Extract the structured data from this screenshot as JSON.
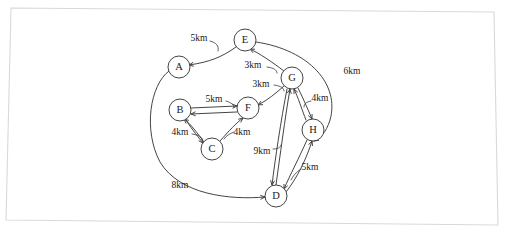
{
  "diagram": {
    "type": "node-link-graph",
    "background_color": "#ffffff",
    "border_color": "#d7d9dd",
    "stroke_color": "#3a3a3a",
    "unit": "km",
    "nodes": [
      {
        "id": "A",
        "label": "A",
        "x": 179,
        "y": 67,
        "r": 11
      },
      {
        "id": "B",
        "label": "B",
        "x": 180,
        "y": 110,
        "r": 11
      },
      {
        "id": "C",
        "label": "C",
        "x": 212,
        "y": 149,
        "r": 11
      },
      {
        "id": "D",
        "label": "D",
        "x": 276,
        "y": 196,
        "r": 11
      },
      {
        "id": "E",
        "label": "E",
        "x": 245,
        "y": 40,
        "r": 11
      },
      {
        "id": "F",
        "label": "F",
        "x": 248,
        "y": 108,
        "r": 11
      },
      {
        "id": "G",
        "label": "G",
        "x": 292,
        "y": 78,
        "r": 11
      },
      {
        "id": "H",
        "label": "H",
        "x": 313,
        "y": 130,
        "r": 11
      }
    ],
    "edges": [
      {
        "id": "e-ae",
        "from": "E",
        "to": "A",
        "weight": "5km",
        "path": "M 236 47 C 222 57 210 62 189 65",
        "arrow_at": "A",
        "arrow_angle": 170,
        "label_x": 199,
        "label_y": 39,
        "leader": "M 210 41 C 217 43 219 46 218 51"
      },
      {
        "id": "e-ge",
        "from": "G",
        "to": "E",
        "weight": "3km",
        "path": "M 284 71 C 272 62 259 53 250 49",
        "arrow_at": "E",
        "arrow_angle": 206,
        "label_x": 253,
        "label_y": 66,
        "leader": "M 267 67 C 274 68 277 70 277 73"
      },
      {
        "id": "e-gf",
        "from": "G",
        "to": "F",
        "weight": "3km",
        "path": "M 284 86 C 276 93 268 100 258 105",
        "arrow_at": "F",
        "arrow_angle": 152,
        "label_x": 261,
        "label_y": 85,
        "leader": "M 274 85 C 281 86 284 88 284 91"
      },
      {
        "id": "e-bf",
        "from": "B",
        "to": "F",
        "weight": "5km",
        "path": "M 191 108 L 237 106",
        "arrow_at": "F",
        "arrow_angle": 177,
        "label_x": 214,
        "label_y": 100,
        "leader": "M 226 101 C 232 103 234 105 234 107"
      },
      {
        "id": "e-fb",
        "from": "F",
        "to": "B",
        "weight": "",
        "path": "M 237 112 L 191 114",
        "arrow_at": "B",
        "arrow_angle": 357,
        "label_x": 0,
        "label_y": 0,
        "leader": ""
      },
      {
        "id": "e-bc",
        "from": "B",
        "to": "C",
        "weight": "4km",
        "path": "M 186 120 C 193 131 199 138 203 143",
        "arrow_at": "C",
        "arrow_angle": 126,
        "label_x": 180,
        "label_y": 133,
        "leader": "M 192 134 C 198 135 201 136 202 139"
      },
      {
        "id": "e-cb",
        "from": "C",
        "to": "B",
        "weight": "",
        "path": "M 204 142 C 197 133 191 124 184 119",
        "arrow_at": "B",
        "arrow_angle": 310,
        "label_x": 0,
        "label_y": 0,
        "leader": ""
      },
      {
        "id": "e-cf",
        "from": "C",
        "to": "F",
        "weight": "4km",
        "path": "M 220 141 C 229 131 236 123 243 118",
        "arrow_at": "F",
        "arrow_angle": 305,
        "label_x": 242,
        "label_y": 133,
        "leader": "M 234 132 C 229 134 226 136 224 139"
      },
      {
        "id": "e-gd",
        "from": "G",
        "to": "D",
        "weight": "9km",
        "path": "M 287 89 C 281 120 275 160 272 185",
        "arrow_at": "D",
        "arrow_angle": 97,
        "label_x": 262,
        "label_y": 152,
        "leader": "M 273 149 C 278 149 280 148 281 145"
      },
      {
        "id": "e-dg",
        "from": "D",
        "to": "G",
        "weight": "",
        "path": "M 276 185 C 280 156 285 118 290 89",
        "arrow_at": "G",
        "arrow_angle": 279,
        "label_x": 0,
        "label_y": 0,
        "leader": ""
      },
      {
        "id": "e-gh",
        "from": "G",
        "to": "H",
        "weight": "4km",
        "path": "M 298 88 C 304 100 309 112 312 119",
        "arrow_at": "H",
        "arrow_angle": 110,
        "label_x": 320,
        "label_y": 99,
        "leader": "M 311 101 C 306 102 304 104 304 107"
      },
      {
        "id": "e-hg",
        "from": "H",
        "to": "G",
        "weight": "",
        "path": "M 306 120 C 302 110 298 97 294 89",
        "arrow_at": "G",
        "arrow_angle": 293,
        "label_x": 0,
        "label_y": 0,
        "leader": ""
      },
      {
        "id": "e-hd",
        "from": "H",
        "to": "D",
        "weight": "5km",
        "path": "M 307 140 C 299 158 290 175 284 189",
        "arrow_at": "D",
        "arrow_angle": 113,
        "label_x": 310,
        "label_y": 168,
        "leader": "M 301 169 C 296 172 293 176 291 180"
      },
      {
        "id": "e-dh",
        "from": "D",
        "to": "H",
        "weight": "",
        "path": "M 286 192 C 297 178 306 160 312 141",
        "arrow_at": "H",
        "arrow_angle": 290,
        "label_x": 0,
        "label_y": 0,
        "leader": ""
      },
      {
        "id": "e-eh",
        "from": "E",
        "to": "H",
        "weight": "6km",
        "path": "M 256 42 C 310 50 340 85 330 120 C 326 133 320 138 314 141",
        "arrow_at": "H",
        "arrow_angle": 160,
        "label_x": 352,
        "label_y": 72,
        "leader": ""
      },
      {
        "id": "e-ad",
        "from": "A",
        "to": "D",
        "weight": "8km",
        "path": "M 169 71 C 150 85 143 130 160 162 C 180 195 230 200 265 197",
        "arrow_at": "D",
        "arrow_angle": 356,
        "label_x": 180,
        "label_y": 186,
        "leader": ""
      }
    ],
    "edge_list_readable": [
      {
        "from": "E",
        "to": "A",
        "distance": "5km"
      },
      {
        "from": "G",
        "to": "E",
        "distance": "3km"
      },
      {
        "from": "G",
        "to": "F",
        "distance": "3km"
      },
      {
        "from": "B",
        "to": "F",
        "distance": "5km"
      },
      {
        "from": "B",
        "to": "C",
        "distance": "4km"
      },
      {
        "from": "C",
        "to": "F",
        "distance": "4km"
      },
      {
        "from": "G",
        "to": "D",
        "distance": "9km"
      },
      {
        "from": "G",
        "to": "H",
        "distance": "4km"
      },
      {
        "from": "H",
        "to": "D",
        "distance": "5km"
      },
      {
        "from": "E",
        "to": "H",
        "distance": "6km"
      },
      {
        "from": "A",
        "to": "D",
        "distance": "8km"
      }
    ]
  }
}
